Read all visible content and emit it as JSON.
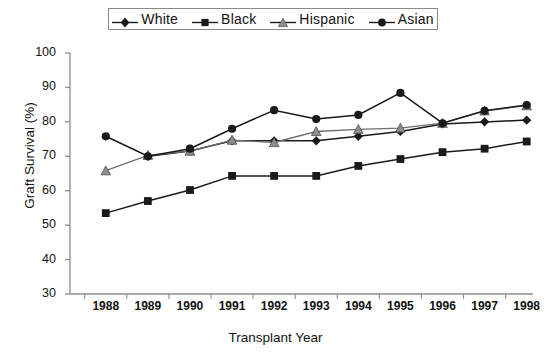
{
  "chart_data": {
    "type": "line",
    "title": "",
    "xlabel": "Transplant Year",
    "ylabel": "Graft Survival (%)",
    "categories": [
      "1988",
      "1989",
      "1990",
      "1991",
      "1992",
      "1993",
      "1994",
      "1995",
      "1996",
      "1997",
      "1998"
    ],
    "x": [
      1988,
      1989,
      1990,
      1991,
      1992,
      1993,
      1994,
      1995,
      1996,
      1997,
      1998
    ],
    "ylim": [
      30,
      100
    ],
    "yticks": [
      30,
      40,
      50,
      60,
      70,
      80,
      90,
      100
    ],
    "ytick_labels": [
      "30",
      "40",
      "50",
      "60",
      "70",
      "80",
      "90",
      "100"
    ],
    "grid": false,
    "legend_position": "top-center",
    "series": [
      {
        "name": "White",
        "marker": "diamond",
        "color": "#1a1a1a",
        "values": [
          null,
          70.0,
          71.5,
          74.5,
          74.5,
          74.5,
          75.8,
          77.2,
          79.4,
          80.0,
          80.5
        ]
      },
      {
        "name": "Black",
        "marker": "square",
        "color": "#1a1a1a",
        "values": [
          53.5,
          57.0,
          60.2,
          64.3,
          64.3,
          64.3,
          67.2,
          69.2,
          71.2,
          72.2,
          74.3
        ]
      },
      {
        "name": "Hispanic",
        "marker": "triangle",
        "color": "#808080",
        "values": [
          65.8,
          70.3,
          71.5,
          74.7,
          74.0,
          77.2,
          77.8,
          78.2,
          79.6,
          83.2,
          84.7
        ]
      },
      {
        "name": "Asian",
        "marker": "circle",
        "color": "#1a1a1a",
        "values": [
          75.8,
          70.0,
          72.2,
          78.0,
          83.4,
          80.8,
          82.0,
          88.4,
          79.6,
          83.2,
          84.9
        ]
      }
    ]
  },
  "legend": {
    "items": [
      {
        "label": "White",
        "marker": "diamond"
      },
      {
        "label": "Black",
        "marker": "square"
      },
      {
        "label": "Hispanic",
        "marker": "triangle"
      },
      {
        "label": "Asian",
        "marker": "circle"
      }
    ]
  }
}
